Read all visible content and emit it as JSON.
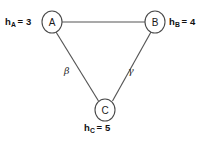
{
  "diagram": {
    "background_color": "#ffffff",
    "edge_color": "#555555",
    "node_stroke_color": "#4a4a4a",
    "node_fill_color": "#ffffff",
    "text_color": "#111111"
  },
  "nodes": [
    {
      "id": "A",
      "letter": "A",
      "cx": 52,
      "cy": 22,
      "rx": 10,
      "ry": 11,
      "heuristic_label": {
        "symbol": "h",
        "subscript": "A",
        "equals": "=",
        "value": "3",
        "full_text": "hA = 3"
      }
    },
    {
      "id": "B",
      "letter": "B",
      "cx": 155,
      "cy": 22,
      "rx": 10,
      "ry": 11,
      "heuristic_label": {
        "symbol": "h",
        "subscript": "B",
        "equals": "=",
        "value": "4",
        "full_text": "hB = 4"
      }
    },
    {
      "id": "C",
      "letter": "C",
      "cx": 105,
      "cy": 110,
      "rx": 10,
      "ry": 11,
      "heuristic_label": {
        "symbol": "h",
        "subscript": "C",
        "equals": "=",
        "value": "5",
        "full_text": "hC = 5"
      }
    }
  ],
  "edges": [
    {
      "id": "edge-a-b",
      "from": "A",
      "to": "B",
      "x1": 62,
      "y1": 22,
      "x2": 145,
      "y2": 22,
      "label": ""
    },
    {
      "id": "edge-a-c",
      "from": "A",
      "to": "C",
      "x1": 56,
      "y1": 32,
      "x2": 98,
      "y2": 101,
      "label": "β"
    },
    {
      "id": "edge-b-c",
      "from": "B",
      "to": "C",
      "x1": 151,
      "y1": 32,
      "x2": 113,
      "y2": 101,
      "label": "γ"
    }
  ],
  "edge_labels": {
    "beta": "β",
    "gamma": "γ"
  }
}
